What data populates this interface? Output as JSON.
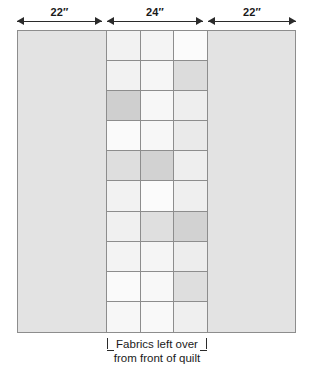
{
  "diagram": {
    "dimensions": [
      {
        "label": "22″",
        "value": 22,
        "unit": "inch",
        "segment": "left-panel"
      },
      {
        "label": "24″",
        "value": 24,
        "unit": "inch",
        "segment": "center-pieced-strip"
      },
      {
        "label": "22″",
        "value": 22,
        "unit": "inch",
        "segment": "right-panel"
      }
    ],
    "caption": {
      "line1": "Fabrics left over",
      "line2": "from front of quilt"
    },
    "colors": {
      "outline": "#8d8d8d",
      "arrow": "#2b2b2b",
      "panel_fill": "#e3e3e3",
      "shade_light": "#fafafa",
      "shade_mid": "#efefef",
      "shade_medium": "#e6e6e6",
      "shade_dark": "#cccccc",
      "background": "#ffffff"
    },
    "left_panel": {
      "fill": "#e3e3e3"
    },
    "right_panel": {
      "fill": "#e3e3e3"
    },
    "strip": {
      "columns": 3,
      "rows": 10,
      "cells": [
        [
          "#f2f2f2",
          "#f4f4f4",
          "#fbfbfb"
        ],
        [
          "#f2f2f2",
          "#f6f6f6",
          "#dcdcdc"
        ],
        [
          "#cfcfcf",
          "#f7f7f7",
          "#eeeeee"
        ],
        [
          "#fafafa",
          "#f7f7f7",
          "#eaeaea"
        ],
        [
          "#dedede",
          "#d2d2d2",
          "#eeeeee"
        ],
        [
          "#f2f2f2",
          "#fbfbfb",
          "#efefef"
        ],
        [
          "#f0f0f0",
          "#dfdfdf",
          "#d2d2d2"
        ],
        [
          "#f3f3f3",
          "#f5f5f5",
          "#ededed"
        ],
        [
          "#fafafa",
          "#f8f8f8",
          "#dedede"
        ],
        [
          "#f7f7f7",
          "#f9f9f9",
          "#efefef"
        ]
      ]
    }
  }
}
